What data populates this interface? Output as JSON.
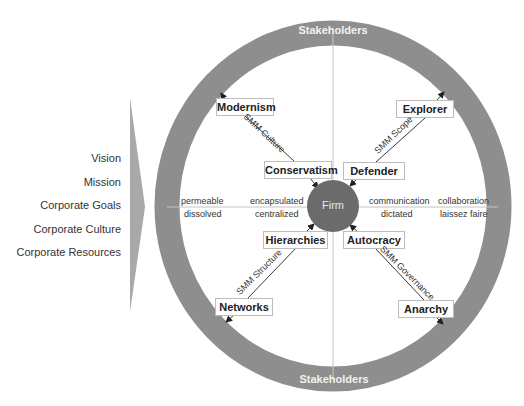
{
  "colors": {
    "ring": "#8e8e8e",
    "firm": "#6b6b6b",
    "arrow_shape": "#a9a9a9",
    "axis_line": "#c4c4c4",
    "box_border": "#bdbdbd"
  },
  "ring": {
    "top_label": "Stakeholders",
    "bottom_label": "Stakeholders"
  },
  "firm": {
    "label": "Firm"
  },
  "left_list": {
    "items": [
      {
        "label": "Vision"
      },
      {
        "label": "Mission"
      },
      {
        "label": "Corporate Goals"
      },
      {
        "label": "Corporate Culture"
      },
      {
        "label": "Corporate Resources"
      }
    ]
  },
  "boxes": {
    "modernism": "Modernism",
    "conservatism": "Conservatism",
    "explorer": "Explorer",
    "defender": "Defender",
    "hierarchies": "Hierarchies",
    "networks": "Networks",
    "autocracy": "Autocracy",
    "anarchy": "Anarchy"
  },
  "diagonals": {
    "culture": "SMM Culture",
    "scope": "SMM Scope",
    "structure": "SMM Structure",
    "governance": "SMM Governance"
  },
  "axis": {
    "left_outer_top": "permeable",
    "left_outer_bottom": "dissolved",
    "left_inner_top": "encapsulated",
    "left_inner_bottom": "centralized",
    "right_inner_top": "communication",
    "right_inner_bottom": "dictated",
    "right_outer_top": "collaboration",
    "right_outer_bottom": "laissez faire"
  }
}
